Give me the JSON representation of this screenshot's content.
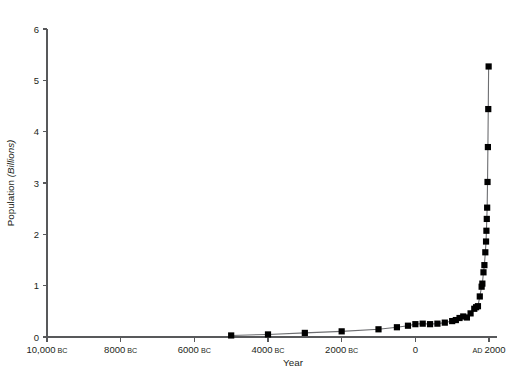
{
  "chart_data": {
    "type": "line",
    "title": "",
    "xlabel": "Year",
    "ylabel": "Population (Billions)",
    "ylabel_plain": "Population ",
    "ylabel_italic": "(Billions)",
    "xlim": [
      -10000,
      2000
    ],
    "ylim": [
      0,
      6
    ],
    "grid": false,
    "legend": null,
    "marker": "filled-square",
    "marker_color": "#000000",
    "line_color": "#6d6e71",
    "xtick_values": [
      -10000,
      -8000,
      -6000,
      -4000,
      -2000,
      0,
      2000
    ],
    "xtick_labels": [
      "10,000 BC",
      "8000 BC",
      "6000 BC",
      "4000 BC",
      "2000 BC",
      "0",
      "AD 2000"
    ],
    "xtick_label_parts": [
      {
        "num": "10,000",
        "era": "BC",
        "era_position": "after"
      },
      {
        "num": "8000",
        "era": "BC",
        "era_position": "after"
      },
      {
        "num": "6000",
        "era": "BC",
        "era_position": "after"
      },
      {
        "num": "4000",
        "era": "BC",
        "era_position": "after"
      },
      {
        "num": "2000",
        "era": "BC",
        "era_position": "after"
      },
      {
        "num": "0",
        "era": "",
        "era_position": "none"
      },
      {
        "num": "2000",
        "era": "AD",
        "era_position": "before"
      }
    ],
    "ytick_values": [
      0,
      1,
      2,
      3,
      4,
      5,
      6
    ],
    "ytick_labels": [
      "0",
      "1",
      "2",
      "3",
      "4",
      "5",
      "6"
    ],
    "series": [
      {
        "name": "World population",
        "x": [
          -5000,
          -4000,
          -3000,
          -2000,
          -1000,
          -500,
          -200,
          1,
          200,
          400,
          600,
          800,
          1000,
          1100,
          1200,
          1300,
          1400,
          1500,
          1600,
          1650,
          1700,
          1750,
          1800,
          1820,
          1850,
          1875,
          1900,
          1920,
          1930,
          1940,
          1950,
          1960,
          1970,
          1980,
          1990
        ],
        "y": [
          0.03,
          0.05,
          0.08,
          0.11,
          0.15,
          0.19,
          0.22,
          0.25,
          0.26,
          0.25,
          0.26,
          0.28,
          0.31,
          0.33,
          0.37,
          0.4,
          0.38,
          0.46,
          0.55,
          0.58,
          0.6,
          0.79,
          0.98,
          1.04,
          1.26,
          1.4,
          1.65,
          1.86,
          2.07,
          2.3,
          2.52,
          3.02,
          3.7,
          4.44,
          5.27
        ]
      }
    ]
  }
}
